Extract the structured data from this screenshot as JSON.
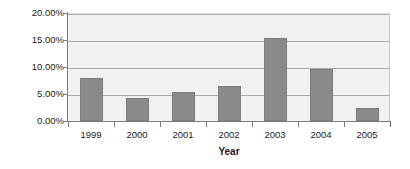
{
  "chart_data": {
    "type": "bar",
    "title": "",
    "xlabel": "Year",
    "ylabel": "% Return",
    "categories": [
      "1999",
      "2000",
      "2001",
      "2002",
      "2003",
      "2004",
      "2005"
    ],
    "values": [
      7.9,
      4.2,
      5.3,
      6.5,
      15.3,
      9.7,
      2.5
    ],
    "value_labels": [
      "7.90%",
      "4.20%",
      "5.30%",
      "6.50%",
      "15.30%",
      "9.70%",
      "2.50%"
    ],
    "ylim": [
      0,
      20
    ],
    "ytick_values": [
      0,
      5,
      10,
      15,
      20
    ],
    "ytick_labels": [
      "0.00%",
      "5.00%",
      "10.00%",
      "15.00%",
      "20.00%"
    ],
    "grid": true,
    "legend": "none",
    "legend_position": "none",
    "series": [
      {
        "name": "% Return",
        "values": [
          7.9,
          4.2,
          5.3,
          6.5,
          15.3,
          9.7,
          2.5
        ]
      }
    ],
    "colors": {
      "bar_fill": "#8a8a8a",
      "bar_border": "#7d7d7d",
      "plot_background": "#f1f1f1",
      "gridline": "#a9a9a9",
      "axis_line": "#7a7a7a",
      "text": "#1a1a1a"
    }
  }
}
